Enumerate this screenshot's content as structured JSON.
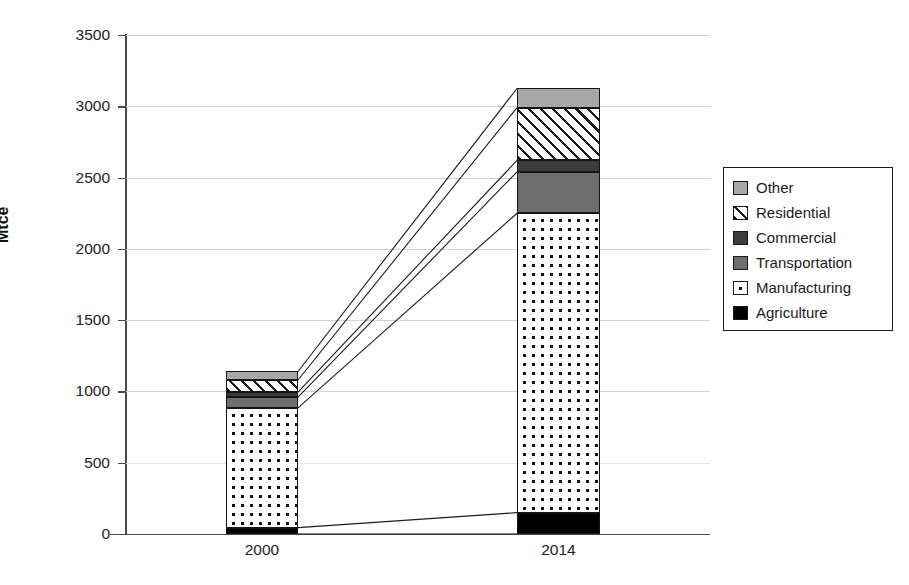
{
  "chart_data": {
    "type": "bar",
    "subtype": "stacked-bar-with-connectors",
    "title": "",
    "xlabel": "",
    "ylabel": "Mtce",
    "categories": [
      "2000",
      "2014"
    ],
    "ylim": [
      0,
      3500
    ],
    "ytick_values": [
      0,
      500,
      1000,
      1500,
      2000,
      2500,
      3000,
      3500
    ],
    "ytick_labels": [
      "0",
      "500",
      "1000",
      "1500",
      "2000",
      "2500",
      "3000",
      "3500"
    ],
    "grid": true,
    "legend_position": "right",
    "stack_order_bottom_to_top": [
      "Agriculture",
      "Manufacturing",
      "Transportation",
      "Commercial",
      "Residential",
      "Other"
    ],
    "series": [
      {
        "name": "Other",
        "values": [
          60,
          135
        ],
        "swatch": "light-gray",
        "color": "#a8a8a8"
      },
      {
        "name": "Residential",
        "values": [
          85,
          370
        ],
        "swatch": "diagonal-hatch",
        "color": "#ffffff"
      },
      {
        "name": "Commercial",
        "values": [
          35,
          80
        ],
        "swatch": "dark-gray",
        "color": "#3c3c3c"
      },
      {
        "name": "Transportation",
        "values": [
          75,
          290
        ],
        "swatch": "medium-gray",
        "color": "#6e6e6e"
      },
      {
        "name": "Manufacturing",
        "values": [
          840,
          2100
        ],
        "swatch": "dotted-white",
        "color": "#ffffff"
      },
      {
        "name": "Agriculture",
        "values": [
          45,
          150
        ],
        "swatch": "black",
        "color": "#000000"
      }
    ],
    "totals": [
      1140,
      3125
    ]
  },
  "legend": {
    "items": [
      {
        "label": "Other"
      },
      {
        "label": "Residential"
      },
      {
        "label": "Commercial"
      },
      {
        "label": "Transportation"
      },
      {
        "label": "Manufacturing"
      },
      {
        "label": "Agriculture"
      }
    ]
  }
}
